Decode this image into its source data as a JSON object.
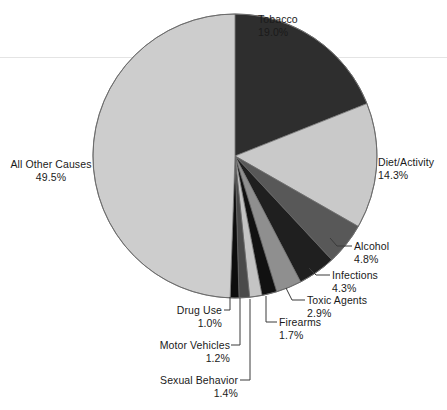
{
  "chart_data": {
    "type": "pie",
    "title": "",
    "subtitle": "",
    "xlabel": "",
    "ylabel": "",
    "legend_position": "none",
    "grid": false,
    "units": "percent",
    "start_angle_deg": 0,
    "direction": "clockwise",
    "categories": [
      "Tobacco",
      "Diet/Activity",
      "Alcohol",
      "Infections",
      "Toxic Agents",
      "Firearms",
      "Sexual Behavior",
      "Motor Vehicles",
      "Drug Use",
      "All Other Causes"
    ],
    "values": [
      19.0,
      14.3,
      4.8,
      4.3,
      2.9,
      1.7,
      1.4,
      1.2,
      1.0,
      49.5
    ],
    "slices": [
      {
        "label": "Tobacco",
        "value": 19.0,
        "value_text": "19.0%",
        "color": "#2e2e2e"
      },
      {
        "label": "Diet/Activity",
        "value": 14.3,
        "value_text": "14.3%",
        "color": "#c9c9c9"
      },
      {
        "label": "Alcohol",
        "value": 4.8,
        "value_text": "4.8%",
        "color": "#585858"
      },
      {
        "label": "Infections",
        "value": 4.3,
        "value_text": "4.3%",
        "color": "#1f1f1f"
      },
      {
        "label": "Toxic Agents",
        "value": 2.9,
        "value_text": "2.9%",
        "color": "#8f8f8f"
      },
      {
        "label": "Firearms",
        "value": 1.7,
        "value_text": "1.7%",
        "color": "#111111"
      },
      {
        "label": "Sexual Behavior",
        "value": 1.4,
        "value_text": "1.4%",
        "color": "#c4c4c4"
      },
      {
        "label": "Motor Vehicles",
        "value": 1.2,
        "value_text": "1.2%",
        "color": "#4a4a4a"
      },
      {
        "label": "Drug Use",
        "value": 1.0,
        "value_text": "1.0%",
        "color": "#0d0d0d"
      },
      {
        "label": "All Other Causes",
        "value": 49.5,
        "value_text": "49.5%",
        "color": "#cdcdcd"
      }
    ]
  },
  "labels": {
    "tobacco": {
      "name": "Tobacco",
      "percent": "19.0%"
    },
    "diet_activity": {
      "name": "Diet/Activity",
      "percent": "14.3%"
    },
    "alcohol": {
      "name": "Alcohol",
      "percent": "4.8%"
    },
    "infections": {
      "name": "Infections",
      "percent": "4.3%"
    },
    "toxic_agents": {
      "name": "Toxic Agents",
      "percent": "2.9%"
    },
    "firearms": {
      "name": "Firearms",
      "percent": "1.7%"
    },
    "sexual_behavior": {
      "name": "Sexual Behavior",
      "percent": "1.4%"
    },
    "motor_vehicles": {
      "name": "Motor Vehicles",
      "percent": "1.2%"
    },
    "drug_use": {
      "name": "Drug Use",
      "percent": "1.0%"
    },
    "all_other": {
      "name": "All Other Causes",
      "percent": "49.5%"
    }
  },
  "style": {
    "outline_color": "#6b6b6b",
    "leader_color": "#3a3a3a",
    "background": "#ffffff",
    "scanline_color": "#e4e4e4"
  }
}
